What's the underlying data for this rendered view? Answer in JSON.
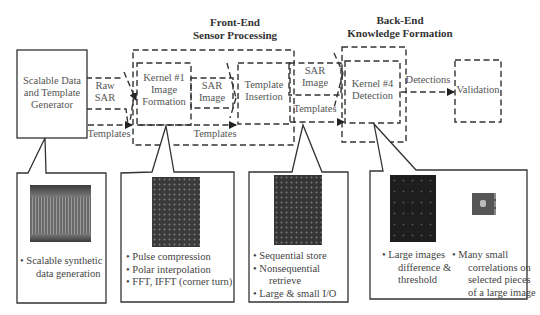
{
  "headers": {
    "front_end": [
      "Front-End",
      "Sensor Processing"
    ],
    "back_end": [
      "Back-End",
      "Knowledge Formation"
    ]
  },
  "nodes": {
    "generator": [
      "Scalable Data",
      "and Template",
      "Generator"
    ],
    "kernel1": [
      "Kernel #1",
      "Image",
      "Formation"
    ],
    "template_insertion": [
      "Template",
      "Insertion"
    ],
    "kernel4": [
      "Kernel #4",
      "Detection"
    ],
    "validation": "Validation"
  },
  "edges": {
    "raw_sar": [
      "Raw",
      "SAR"
    ],
    "templates_1": "Templates",
    "sar_image_1": [
      "SAR",
      "Image"
    ],
    "templates_2": "Templates",
    "sar_image_2": [
      "SAR",
      "Image"
    ],
    "templates_3": "Templates",
    "detections": "Detections"
  },
  "callouts": [
    {
      "id": "generator",
      "bullets": [
        "Scalable synthetic",
        "data generation"
      ],
      "bullet_lines": [
        [
          "Scalable synthetic",
          "data generation"
        ]
      ]
    },
    {
      "id": "kernel1",
      "bullets": [
        "Pulse compression",
        "Polar interpolation",
        "FFT, IFFT (corner turn)"
      ]
    },
    {
      "id": "store",
      "bullets": [
        "Sequential store",
        "Nonsequential retrieve",
        "Large & small I/O"
      ],
      "bullet_lines": [
        [
          "Sequential store"
        ],
        [
          "Nonsequential",
          "retrieve"
        ],
        [
          "Large & small I/O"
        ]
      ]
    },
    {
      "id": "kernel4",
      "bullets_left": [
        "Large images difference & threshold"
      ],
      "bullet_lines_left": [
        "Large images",
        "difference &",
        "threshold"
      ],
      "bullets_right": [
        "Many small correlations on selected pieces of a large image"
      ],
      "bullet_lines_right": [
        "Many small",
        "correlations on",
        "selected pieces",
        "of a large image"
      ]
    }
  ],
  "icons": {
    "thumb1": "synthetic-sar-data-image",
    "thumb2": "formed-sar-image",
    "thumb3": "stored-sar-image",
    "thumb4a": "difference-image",
    "thumb4b": "correlation-chip-image"
  }
}
